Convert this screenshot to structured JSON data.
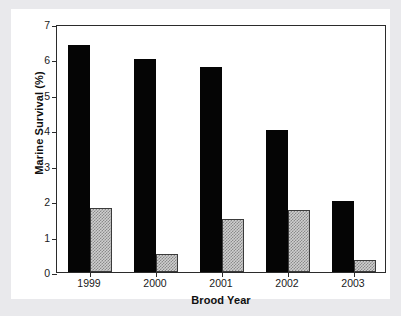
{
  "chart_data": {
    "type": "bar",
    "title": "",
    "xlabel": "Brood Year",
    "ylabel": "Marine Survival (%)",
    "categories": [
      "1999",
      "2000",
      "2001",
      "2002",
      "2003"
    ],
    "series": [
      {
        "name": "black-series",
        "style": "solid-black",
        "values": [
          6.4,
          6.0,
          5.8,
          4.0,
          2.0
        ]
      },
      {
        "name": "hatched-series",
        "style": "gray-crosshatch",
        "values": [
          1.8,
          0.5,
          1.5,
          1.75,
          0.35
        ]
      }
    ],
    "ylim": [
      0,
      7
    ],
    "yticks": [
      0,
      1,
      2,
      3,
      4,
      5,
      6,
      7
    ],
    "ytick_labels": [
      "0",
      "1",
      "2",
      "3",
      "4",
      "5",
      "6",
      "7"
    ],
    "grid": false,
    "legend": "none",
    "frame": "full-box"
  },
  "colors": {
    "figure_background": "#ffffff",
    "outer_background": "#e9e9ec",
    "axis": "#2b2b2b",
    "series_black": "#050505",
    "series_hatch_fill": "#cfcfcf",
    "series_hatch_line": "#8a8a8a",
    "text": "#1a1a1a"
  }
}
